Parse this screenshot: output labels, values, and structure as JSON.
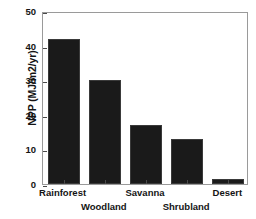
{
  "chart_data": {
    "type": "bar",
    "title": "",
    "xlabel": "",
    "ylabel": "NPP (MJ/m2/yr)",
    "categories": [
      "Rainforest",
      "Woodland",
      "Savanna",
      "Shrubland",
      "Desert"
    ],
    "values": [
      42,
      30,
      17,
      13,
      1.5
    ],
    "ylim": [
      0,
      50
    ],
    "yticks": [
      0,
      10,
      20,
      30,
      40,
      50
    ],
    "ytick_labels": [
      "0",
      "10",
      "20",
      "30",
      "40",
      "50"
    ],
    "grid": false,
    "legend": null,
    "bar_color": "#1a1a1a",
    "frame_color": "#9a9a9a",
    "background": "#ffffff",
    "xlabel_rows": [
      1,
      2,
      1,
      2,
      1
    ]
  }
}
